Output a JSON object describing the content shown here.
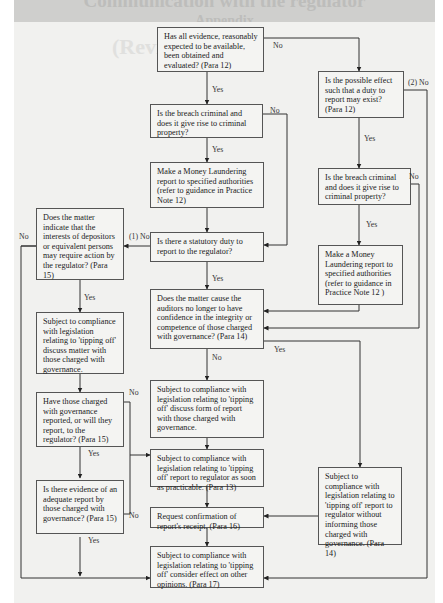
{
  "title_banner": {
    "line1": "Communication with the regulator",
    "line2": "Appendix",
    "line3": "(Revised 2014)"
  },
  "boxes": {
    "evidence": "Has all evidence, reasonably expected to be available, been obtained and evaluated? (Para 12)",
    "possible_effect": "Is the possible effect such that a duty to report may exist? (Para 12)",
    "breach_criminal_left": "Is the breach criminal and does it give rise to criminal property?",
    "money_laundering_left": "Make a Money Laundering report to specified authorities (refer to guidance in Practice Note 12)",
    "breach_criminal_right": "Is the breach criminal and does it give rise to criminal property?",
    "money_laundering_right": "Make a Money Laundering report to specified authorities (refer to guidance in Practice Note 12 )",
    "statutory_duty": "Is there a statutory duty to report to the regulator?",
    "depositors": "Does the matter indicate that the interests of depositors or equivalent persons may require action by the regulator? (Para 15)",
    "discuss_matter": "Subject to compliance with legislation relating to 'tipping off' discuss matter with those charged with governance.",
    "confidence": "Does the matter cause the auditors no longer to have confidence in the integrity or competence of those charged with governance? (Para 14)",
    "have_reported": "Have those charged with governance reported, or will they report, to the regulator? (Para 15)",
    "discuss_form": "Subject to compliance with legislation relating to 'tipping off' discuss form of report with those charged with governance.",
    "report_asap": "Subject to compliance with legislation relating to 'tipping off' report to regulator as soon as practicable. (Para 13)",
    "adequate_report": "Is there evidence of an adequate report by those charged with governance? (Para 15)",
    "without_informing": "Subject to compliance with legislation relating to 'tipping off' report to regulator without informing those charged with governance. (Para 14)",
    "request_confirmation": "Request confirmation of report's receipt. (Para 16)",
    "consider_effect": "Subject to compliance with legislation relating to 'tipping off' consider effect on other opinions. (Para 17)"
  },
  "labels": {
    "evidence_no": "No",
    "evidence_yes": "Yes",
    "possible_effect_no": "(2) No",
    "possible_effect_yes": "Yes",
    "breach_left_no": "No",
    "breach_left_yes": "Yes",
    "breach_right_no": "No",
    "breach_right_yes": "Yes",
    "statutory_no": "(1) No",
    "statutory_yes": "Yes",
    "depositors_no": "No",
    "depositors_yes": "Yes",
    "confidence_no": "No",
    "confidence_yes": "Yes",
    "have_reported_no": "No",
    "have_reported_yes": "Yes",
    "adequate_no": "No",
    "adequate_yes": "Yes"
  }
}
